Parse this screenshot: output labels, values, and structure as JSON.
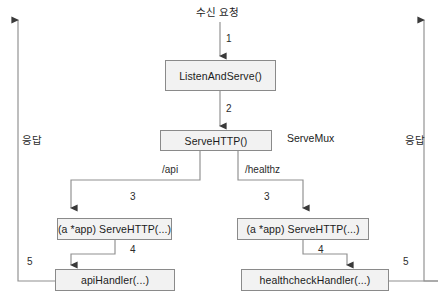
{
  "diagram": {
    "title_label": "수신 요청",
    "mux_label": "ServeMux",
    "side_labels": {
      "left": "응답",
      "right": "응답"
    },
    "nodes": [
      {
        "id": "listen_and_serve",
        "label": "ListenAndServe()"
      },
      {
        "id": "serve_http_mux",
        "label": "ServeHTTP()"
      },
      {
        "id": "app_serve_http_api",
        "label": "(a *app) ServeHTTP(...)"
      },
      {
        "id": "app_serve_http_healthz",
        "label": "(a *app) ServeHTTP(...)"
      },
      {
        "id": "api_handler",
        "label": "apiHandler(...)"
      },
      {
        "id": "healthcheck_handler",
        "label": "healthcheckHandler(...)"
      }
    ],
    "route_labels": {
      "api": "/api",
      "healthz": "/healthz"
    },
    "step_numbers": {
      "incoming": "1",
      "to_mux": "2",
      "branch_api": "3",
      "branch_healthz": "3",
      "api_handler": "4",
      "healthcheck_handler": "4",
      "response_left": "5",
      "response_right": "5"
    },
    "colors": {
      "node_fill": "#f2f2f2",
      "node_stroke": "#8a8a8a",
      "line": "#8f8f8f",
      "arrow": "#3a3a3a",
      "text": "#1b1b1b"
    }
  }
}
